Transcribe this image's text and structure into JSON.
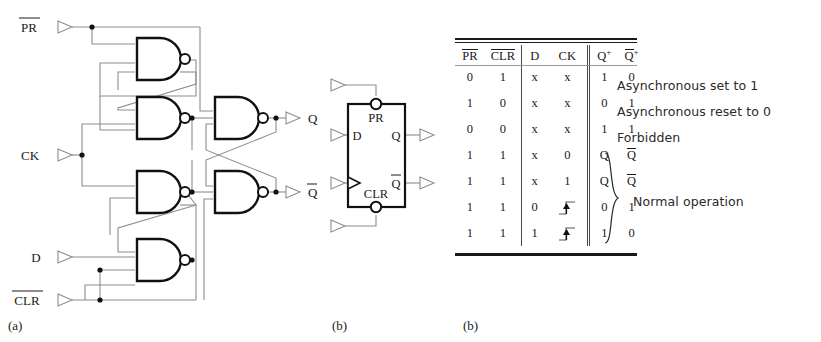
{
  "figure": {
    "captions": {
      "a": "(a)",
      "b": "(b)",
      "c": "(b)"
    }
  },
  "schematic": {
    "inputs": [
      {
        "name": "pr",
        "label": "PR",
        "overline": true
      },
      {
        "name": "ck",
        "label": "CK",
        "overline": false
      },
      {
        "name": "d",
        "label": "D",
        "overline": false
      },
      {
        "name": "clr",
        "label": "CLR",
        "overline": true
      }
    ],
    "outputs": [
      {
        "name": "q",
        "label": "Q",
        "overline": false
      },
      {
        "name": "qbar",
        "label": "Q",
        "overline": true
      }
    ],
    "gate_type": "NAND",
    "gate_count": 6
  },
  "symbol": {
    "preset_label": "PR",
    "clear_label": "CLR",
    "d_label": "D",
    "q_label": "Q",
    "qbar_label": "Q",
    "clock_input": "edge-triggered"
  },
  "truth_table": {
    "headers": [
      {
        "text": "PR",
        "overline": true,
        "sup": ""
      },
      {
        "text": "CLR",
        "overline": true,
        "sup": ""
      },
      {
        "text": "D",
        "overline": false,
        "sup": ""
      },
      {
        "text": "CK",
        "overline": false,
        "sup": ""
      },
      {
        "text": "Q",
        "overline": false,
        "sup": "+"
      },
      {
        "text": "Q",
        "overline": true,
        "sup": "+"
      }
    ],
    "rows": [
      {
        "pr": "0",
        "clr": "1",
        "d": "x",
        "ck": "x",
        "q": "1",
        "qb": "0",
        "qb_overline": false,
        "note": "Asynchronous set to 1"
      },
      {
        "pr": "1",
        "clr": "0",
        "d": "x",
        "ck": "x",
        "q": "0",
        "qb": "1",
        "qb_overline": false,
        "note": "Asynchronous reset to 0"
      },
      {
        "pr": "0",
        "clr": "0",
        "d": "x",
        "ck": "x",
        "q": "1",
        "qb": "1",
        "qb_overline": false,
        "note": "Forbidden"
      },
      {
        "pr": "1",
        "clr": "1",
        "d": "x",
        "ck": "0",
        "q": "Q",
        "qb": "Q",
        "qb_overline": true,
        "note": ""
      },
      {
        "pr": "1",
        "clr": "1",
        "d": "x",
        "ck": "1",
        "q": "Q",
        "qb": "Q",
        "qb_overline": true,
        "note": ""
      },
      {
        "pr": "1",
        "clr": "1",
        "d": "0",
        "ck": "edge",
        "q": "0",
        "qb": "1",
        "qb_overline": false,
        "note": ""
      },
      {
        "pr": "1",
        "clr": "1",
        "d": "1",
        "ck": "edge",
        "q": "1",
        "qb": "0",
        "qb_overline": false,
        "note": ""
      }
    ],
    "annotations": [
      "Asynchronous set to 1",
      "Asynchronous reset to 0",
      "Forbidden",
      "Normal operation"
    ],
    "brace_label": "Normal operation"
  },
  "colors": {
    "ink": "#1a1a1a",
    "wire": "#8d8d8d",
    "gate": "#111111",
    "background": "#ffffff"
  }
}
